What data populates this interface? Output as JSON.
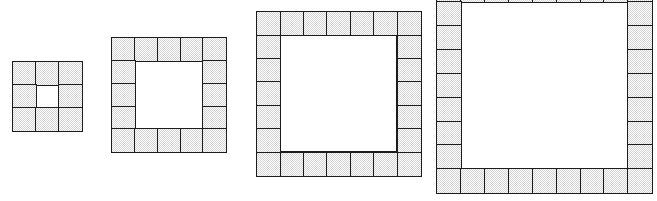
{
  "figure": {
    "canvas": {
      "width": 657,
      "height": 201,
      "background": "#ffffff"
    },
    "tile_style": {
      "fill": "#d4d4d4",
      "fill_pattern": "dithered-halftone-gray",
      "stroke": "#1c1c1c",
      "stroke_width": 1.6,
      "hole_fill": "#ffffff"
    }
  },
  "chart_data": {
    "type": "diagram",
    "xlabel": "",
    "ylabel": "",
    "categories": [
      "Figure 1",
      "Figure 2",
      "Figure 3",
      "Figure 4"
    ],
    "values": [
      8,
      16,
      24,
      32
    ],
    "series": [
      {
        "name": "shaded tiles (perimeter)",
        "values": [
          8,
          16,
          24,
          32
        ]
      },
      {
        "name": "outer side length (tiles)",
        "values": [
          3,
          5,
          7,
          9
        ]
      },
      {
        "name": "inner hole side (tiles)",
        "values": [
          1,
          3,
          5,
          7
        ]
      }
    ],
    "annotations": [
      "Figure n has outer side 2n+1 tiles",
      "Shaded tile count = 8n"
    ]
  },
  "figures": [
    {
      "id": "figure-1",
      "label": "Figure 1",
      "outer_side": 3,
      "hole_side": 1,
      "shaded_tiles": 8,
      "x": 13,
      "y": 62,
      "tile_px": 23.0,
      "clipped_top": false
    },
    {
      "id": "figure-2",
      "label": "Figure 2",
      "outer_side": 5,
      "hole_side": 3,
      "shaded_tiles": 16,
      "x": 112,
      "y": 38,
      "tile_px": 22.8,
      "clipped_top": false
    },
    {
      "id": "figure-3",
      "label": "Figure 3",
      "outer_side": 7,
      "hole_side": 5,
      "shaded_tiles": 24,
      "x": 257,
      "y": 12,
      "tile_px": 23.4,
      "clipped_top": false
    },
    {
      "id": "figure-4",
      "label": "Figure 4",
      "outer_side": 9,
      "hole_side": 7,
      "shaded_tiles": 32,
      "x": 437,
      "y": -22,
      "tile_px": 23.9,
      "clipped_top": true
    }
  ]
}
